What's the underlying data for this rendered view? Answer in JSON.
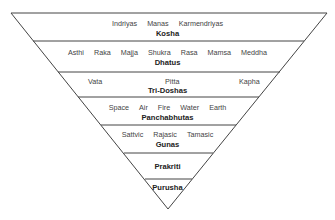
{
  "diagram": {
    "type": "inverted-pyramid",
    "layers": [
      {
        "title": "Kosha",
        "items": [
          "Indriyas",
          "Manas",
          "Karmendriyas"
        ]
      },
      {
        "title": "Dhatus",
        "items": [
          "Asthi",
          "Raka",
          "Majja",
          "Shukra",
          "Rasa",
          "Mamsa",
          "Meddha"
        ]
      },
      {
        "title": "Tri-Doshas",
        "items": [
          "Vata",
          "Pitta",
          "Kapha"
        ]
      },
      {
        "title": "Panchabhutas",
        "items": [
          "Space",
          "Air",
          "Fire",
          "Water",
          "Earth"
        ]
      },
      {
        "title": "Gunas",
        "items": [
          "Sattvic",
          "Rajasic",
          "Tamasic"
        ]
      },
      {
        "title": "Prakriti",
        "items": []
      },
      {
        "title": "Purusha",
        "items": []
      }
    ]
  }
}
